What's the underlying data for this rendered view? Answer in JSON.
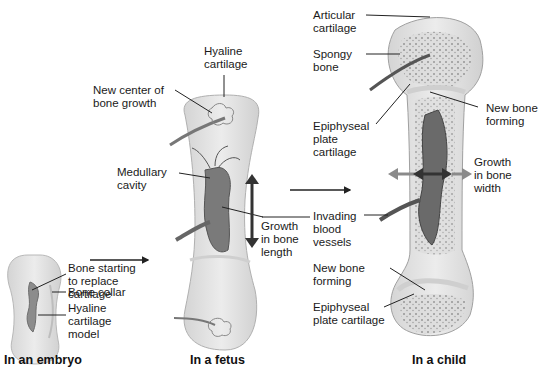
{
  "stages": [
    {
      "id": "embryo",
      "caption": "In an embryo"
    },
    {
      "id": "fetus",
      "caption": "In a fetus"
    },
    {
      "id": "child",
      "caption": "In a child"
    }
  ],
  "labels": {
    "embryo": {
      "bone_starting": "Bone starting\nto replace\ncartilage",
      "bone_collar": "Bone collar",
      "hyaline_model": "Hyaline\ncartilage\nmodel"
    },
    "fetus": {
      "hyaline_cartilage": "Hyaline\ncartilage",
      "new_center": "New center of\nbone growth",
      "medullary_cavity": "Medullary\ncavity",
      "growth_length": "Growth\nin bone\nlength"
    },
    "child": {
      "articular_cartilage": "Articular\ncartilage",
      "spongy_bone": "Spongy\nbone",
      "epiphyseal_plate_top": "Epiphyseal\nplate\ncartilage",
      "new_bone_top": "New bone\nforming",
      "growth_width": "Growth\nin bone\nwidth",
      "invading_vessels": "Invading\nblood\nvessels",
      "new_bone_bottom": "New bone\nforming",
      "epiphyseal_plate_bottom": "Epiphyseal\nplate cartilage"
    }
  },
  "colors": {
    "cartilage": "#e6e6e6",
    "bone_outline": "#a8a8a8",
    "vessel": "#555555",
    "arrow_dark": "#333333",
    "arrow_light": "#8a8a8a"
  }
}
